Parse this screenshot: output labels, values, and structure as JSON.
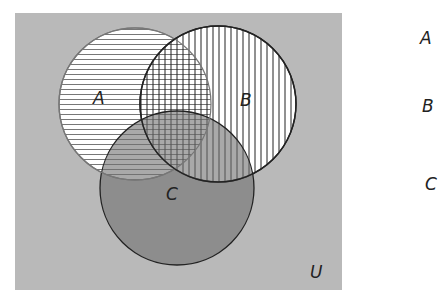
{
  "diagram": {
    "type": "venn",
    "universe_label": "U",
    "sets": [
      {
        "label": "A",
        "pattern": "horizontal-lines"
      },
      {
        "label": "B",
        "pattern": "vertical-lines"
      },
      {
        "label": "C",
        "pattern": "dark-gray-shading"
      }
    ],
    "legend": [
      "A",
      "B",
      "C"
    ],
    "colors": {
      "universe": "#b9b9b9",
      "set_c": "#8a8a8a",
      "lines": "#555555",
      "outline": "#222222"
    }
  }
}
